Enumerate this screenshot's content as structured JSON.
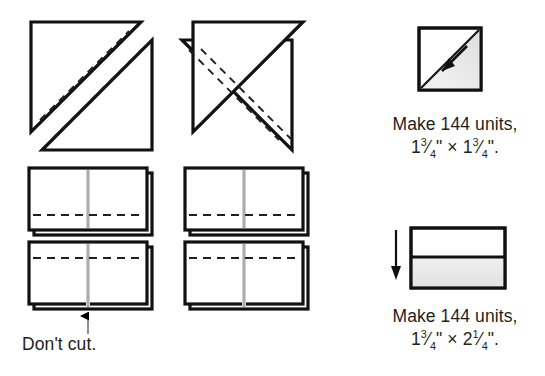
{
  "illustration": {
    "title": "Quilt block cutting and pressing diagram",
    "colors": {
      "ink": "#000000",
      "line": "#231f20",
      "shade": "#e9e9e9",
      "fold_line": "#b8b8b8",
      "paper": "#ffffff"
    },
    "left_panel": {
      "row1": {
        "name": "half-square-triangle-marking",
        "shapes": [
          {
            "id": "hst-left",
            "mirror": false,
            "dashed_sewing_lines": 2
          },
          {
            "id": "hst-right",
            "mirror": true,
            "dashed_sewing_lines": 2
          }
        ]
      },
      "row2": {
        "name": "rectangle-units-dashed-bottom",
        "shapes": [
          {
            "id": "rect-top-left",
            "dash_position": "lower"
          },
          {
            "id": "rect-top-right",
            "dash_position": "lower"
          }
        ]
      },
      "row3": {
        "name": "rectangle-units-dashed-top",
        "shapes": [
          {
            "id": "rect-bottom-left",
            "dash_position": "upper"
          },
          {
            "id": "rect-bottom-right",
            "dash_position": "upper"
          }
        ]
      },
      "annotation": {
        "label": "Don't cut.",
        "arrow": "up-arrow-pointing-to-center-seam"
      }
    },
    "right_panel": {
      "unit1": {
        "icon": "pressed-half-square-triangle-unit",
        "press_arrow": "diagonal-press-arrow",
        "caption_line1": "Make 144 units,",
        "caption_line2_whole1": "1",
        "caption_line2_frac1_num": "3",
        "caption_line2_frac1_den": "4",
        "caption_line2_mid": "\" × ",
        "caption_line2_whole2": "1",
        "caption_line2_frac2_num": "3",
        "caption_line2_frac2_den": "4",
        "caption_line2_end": "\".",
        "caption_plain": "Make 144 units, 1¾\" × 1¾\"."
      },
      "unit2": {
        "icon": "pressed-rectangle-unit",
        "press_arrow": "down-press-arrow",
        "caption_line1": "Make 144 units,",
        "caption_line2_whole1": "1",
        "caption_line2_frac1_num": "3",
        "caption_line2_frac1_den": "4",
        "caption_line2_mid": "\" × ",
        "caption_line2_whole2": "2",
        "caption_line2_frac2_num": "1",
        "caption_line2_frac2_den": "4",
        "caption_line2_end": "\".",
        "caption_plain": "Make 144 units, 1¾\" × 2¼\"."
      }
    }
  }
}
